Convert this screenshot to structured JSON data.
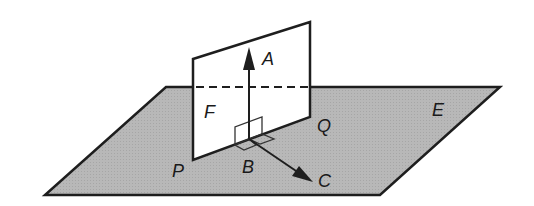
{
  "diagram": {
    "colors": {
      "plane_E_fill": "#b4b4b4",
      "plane_F_fill": "#ffffff",
      "stroke": "#1e1e1e",
      "background": "#ffffff"
    },
    "labels": {
      "A": "A",
      "B": "B",
      "C": "C",
      "E": "E",
      "F": "F",
      "P": "P",
      "Q": "Q"
    },
    "planes": {
      "E": {
        "points": [
          [
            166,
            87
          ],
          [
            500,
            87
          ],
          [
            380,
            195
          ],
          [
            45,
            195
          ]
        ]
      },
      "F": {
        "points": [
          [
            193,
            59
          ],
          [
            310,
            22
          ],
          [
            310,
            117
          ],
          [
            193,
            160
          ]
        ]
      }
    },
    "intersection_line": {
      "from": [
        193,
        87
      ],
      "to": [
        310,
        87
      ],
      "style": "dashed"
    },
    "vectors": {
      "BA": {
        "from": [
          249,
          139
        ],
        "to": [
          249,
          47
        ]
      },
      "BC": {
        "from": [
          249,
          139
        ],
        "to": [
          313,
          182
        ]
      }
    }
  }
}
